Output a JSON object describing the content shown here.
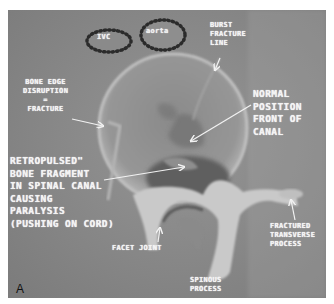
{
  "figure": {
    "panel_label": "A"
  },
  "labels": {
    "ivc": "IVC",
    "aorta": "aorta",
    "burst_fracture_line": "BURST\nFRACTURE\nLINE",
    "bone_edge_disruption": "BONE EDGE\nDISRUPTION\n=\nFRACTURE",
    "normal_position": "NORMAL\nPOSITION\nFRONT OF\nCANAL",
    "retropulsed": "RETROPULSED\"\nBONE FRAGMENT\nIN SPINAL CANAL\nCAUSING\nPARALYSIS\n(PUSHING ON CORD)",
    "facet_joint": "FACET JOINT",
    "fractured_transverse": "FRACTURED\nTRANSVERSE\nPROCESS",
    "spinous_process": "SPINOUS\nPROCESS"
  }
}
